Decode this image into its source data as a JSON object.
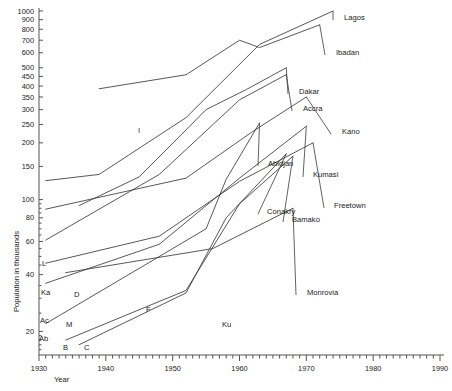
{
  "chart_data": {
    "type": "line",
    "title": "",
    "xlabel": "Year",
    "ylabel": "Population in thousands",
    "yscale": "log",
    "xlim": [
      1930,
      1990
    ],
    "ylim": [
      15,
      1000
    ],
    "grid": false,
    "legend_position": "inline-end-labels",
    "x_ticks": [
      1930,
      1940,
      1950,
      1960,
      1970,
      1980,
      1990
    ],
    "x_tick_labels": [
      "1930",
      "1940",
      "1950",
      "1960",
      "1970",
      "1980",
      "1990"
    ],
    "x_minor_tick_interval": 1,
    "y_ticks": [
      20,
      40,
      60,
      80,
      100,
      150,
      200,
      250,
      300,
      350,
      400,
      450,
      500,
      600,
      700,
      800,
      900,
      1000
    ],
    "y_tick_labels": [
      "20",
      "40",
      "60",
      "80",
      "100",
      "150",
      "200",
      "250",
      "300",
      "350",
      "400",
      "450",
      "500",
      "600",
      "700",
      "800",
      "900",
      "1000"
    ],
    "series": [
      {
        "name": "Lagos",
        "label": "Lagos",
        "short_label": "L",
        "label_side": "right",
        "x": [
          1931,
          1939,
          1952,
          1963,
          1974
        ],
        "values": [
          126,
          136,
          272,
          665,
          1000
        ]
      },
      {
        "name": "Ibadan",
        "label": "Ibadan",
        "short_label": "I",
        "label_side": "right",
        "x": [
          1939,
          1952,
          1960,
          1963,
          1972
        ],
        "values": [
          387,
          459,
          700,
          640,
          845
        ]
      },
      {
        "name": "Dakar",
        "label": "Dakar",
        "short_label": "D",
        "label_side": "right",
        "x": [
          1936,
          1945,
          1955,
          1961,
          1967
        ],
        "values": [
          93,
          132,
          300,
          383,
          500
        ]
      },
      {
        "name": "Accra",
        "label": "Accra",
        "short_label": "Ac",
        "label_side": "right",
        "x": [
          1931,
          1948,
          1960,
          1967
        ],
        "values": [
          61,
          136,
          338,
          460
        ]
      },
      {
        "name": "Kano",
        "label": "Kano",
        "short_label": "Ka",
        "label_side": "right",
        "x": [
          1931,
          1952,
          1962,
          1970
        ],
        "values": [
          89,
          130,
          230,
          350
        ]
      },
      {
        "name": "Abidjan",
        "label": "Abidjan",
        "short_label": "Ab",
        "label_side": "right",
        "x": [
          1931,
          1955,
          1958,
          1963
        ],
        "values": [
          22,
          70,
          128,
          255
        ]
      },
      {
        "name": "Kumasi",
        "label": "Kumasi",
        "short_label": "Ku",
        "label_side": "right",
        "x": [
          1931,
          1948,
          1960,
          1970
        ],
        "values": [
          36,
          58,
          130,
          245
        ]
      },
      {
        "name": "Conakry",
        "label": "Conakry",
        "short_label": "C",
        "label_side": "right",
        "x": [
          1936,
          1952,
          1958,
          1967
        ],
        "values": [
          17,
          32,
          80,
          175
        ]
      },
      {
        "name": "Bamako",
        "label": "Bamako",
        "short_label": "B",
        "label_side": "right",
        "x": [
          1934,
          1952,
          1960,
          1968
        ],
        "values": [
          18,
          33,
          95,
          170
        ]
      },
      {
        "name": "Freetown",
        "label": "Freetown",
        "short_label": "F",
        "label_side": "right",
        "x": [
          1931,
          1948,
          1960,
          1971
        ],
        "values": [
          46,
          64,
          125,
          200
        ]
      },
      {
        "name": "Monrovia",
        "label": "Monrovia",
        "short_label": "M",
        "label_side": "right",
        "x": [
          1934,
          1956,
          1968
        ],
        "values": [
          41,
          55,
          90
        ]
      }
    ]
  },
  "axes": {
    "y_title": "Population in thousands",
    "x_title": "Year"
  }
}
